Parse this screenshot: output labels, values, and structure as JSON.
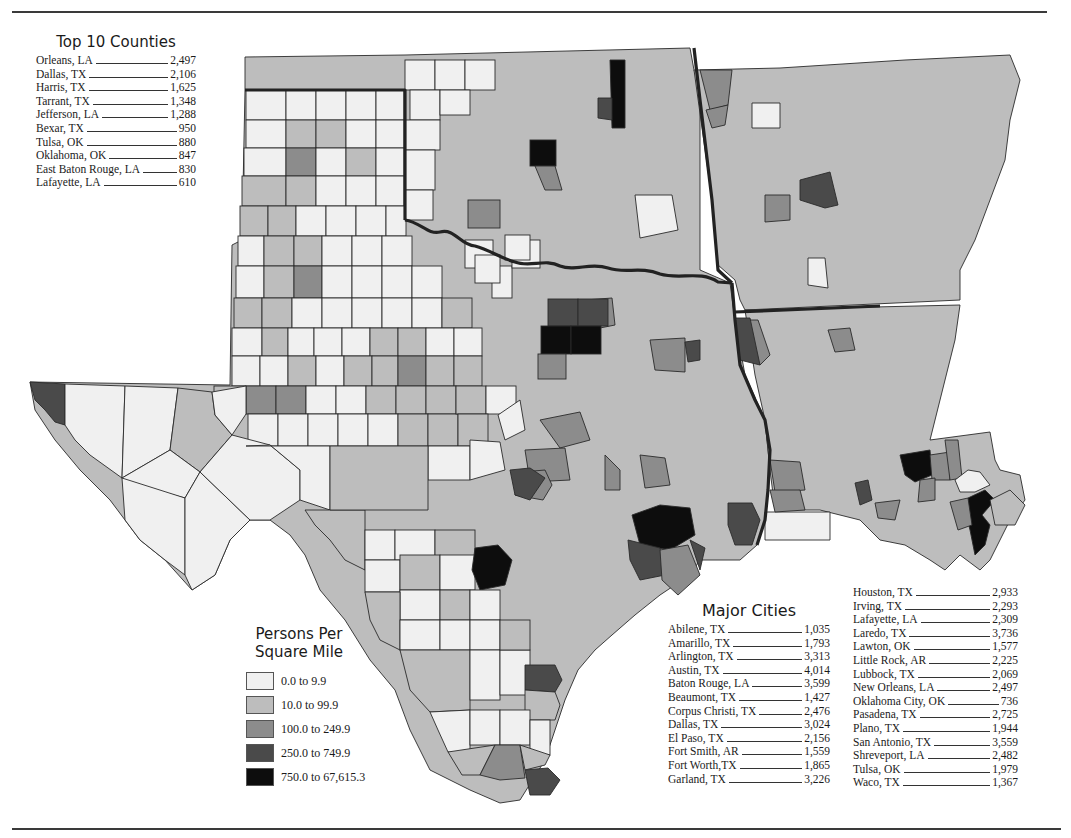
{
  "top_counties": {
    "title": "Top 10 Counties",
    "items": [
      {
        "name": "Orleans, LA",
        "value": "2,497"
      },
      {
        "name": "Dallas, TX",
        "value": "2,106"
      },
      {
        "name": "Harris, TX",
        "value": "1,625"
      },
      {
        "name": "Tarrant, TX",
        "value": "1,348"
      },
      {
        "name": "Jefferson, LA",
        "value": "1,288"
      },
      {
        "name": "Bexar, TX",
        "value": "950"
      },
      {
        "name": "Tulsa, OK",
        "value": "880"
      },
      {
        "name": "Oklahoma, OK",
        "value": "847"
      },
      {
        "name": "East Baton Rouge, LA",
        "value": "830"
      },
      {
        "name": "Lafayette, LA",
        "value": "610"
      }
    ]
  },
  "legend": {
    "title_line1": "Persons Per",
    "title_line2": "Square Mile",
    "classes": [
      {
        "label": "0.0 to 9.9",
        "color": "#f0f0f0"
      },
      {
        "label": "10.0 to 99.9",
        "color": "#bdbdbd"
      },
      {
        "label": "100.0 to 249.9",
        "color": "#8c8c8c"
      },
      {
        "label": "250.0 to 749.9",
        "color": "#4a4a4a"
      },
      {
        "label": "750.0 to 67,615.3",
        "color": "#0d0d0d"
      }
    ]
  },
  "major_cities": {
    "title": "Major Cities",
    "column1": [
      {
        "name": "Abilene, TX",
        "value": "1,035"
      },
      {
        "name": "Amarillo, TX",
        "value": "1,793"
      },
      {
        "name": "Arlington, TX",
        "value": "3,313"
      },
      {
        "name": "Austin, TX",
        "value": "4,014"
      },
      {
        "name": "Baton Rouge, LA",
        "value": "3,599"
      },
      {
        "name": "Beaumont, TX",
        "value": "1,427"
      },
      {
        "name": "Corpus Christi, TX",
        "value": "2,476"
      },
      {
        "name": "Dallas, TX",
        "value": "3,024"
      },
      {
        "name": "El Paso, TX",
        "value": "2,156"
      },
      {
        "name": "Fort Smith, AR",
        "value": "1,559"
      },
      {
        "name": "Fort Worth,TX",
        "value": "1,865"
      },
      {
        "name": "Garland, TX",
        "value": "3,226"
      }
    ],
    "column2": [
      {
        "name": "Houston, TX",
        "value": "2,933"
      },
      {
        "name": "Irving, TX",
        "value": "2,293"
      },
      {
        "name": "Lafayette, LA",
        "value": "2,309"
      },
      {
        "name": "Laredo, TX",
        "value": "3,736"
      },
      {
        "name": "Lawton, OK",
        "value": "1,577"
      },
      {
        "name": "Little Rock, AR",
        "value": "2,225"
      },
      {
        "name": "Lubbock, TX",
        "value": "2,069"
      },
      {
        "name": "New Orleans, LA",
        "value": "2,497"
      },
      {
        "name": "Oklahoma City, OK",
        "value": "736"
      },
      {
        "name": "Pasadena, TX",
        "value": "2,725"
      },
      {
        "name": "Plano, TX",
        "value": "1,944"
      },
      {
        "name": "San Antonio, TX",
        "value": "3,559"
      },
      {
        "name": "Shreveport, LA",
        "value": "2,482"
      },
      {
        "name": "Tulsa, OK",
        "value": "1,979"
      },
      {
        "name": "Waco, TX",
        "value": "1,367"
      }
    ]
  },
  "map": {
    "states": [
      "Texas",
      "Oklahoma",
      "Arkansas",
      "Louisiana"
    ],
    "colors": {
      "c0": "#f0f0f0",
      "c1": "#bdbdbd",
      "c2": "#8c8c8c",
      "c3": "#4a4a4a",
      "c4": "#0d0d0d",
      "county_line": "#2a2a2a",
      "state_line": "#222222"
    }
  }
}
